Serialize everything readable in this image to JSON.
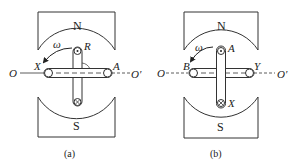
{
  "figure": {
    "panels": [
      {
        "caption": "(a)",
        "north_label": "N",
        "south_label": "S",
        "omega_label": "ω",
        "axis_left": "O",
        "axis_right": "O′",
        "left_end_label": "X",
        "right_end_label": "A",
        "top_label": "R",
        "bottom_label": ""
      },
      {
        "caption": "(b)",
        "north_label": "N",
        "south_label": "S",
        "omega_label": "ω",
        "axis_left": "O",
        "axis_right": "O′",
        "left_end_label": "B",
        "right_end_label": "Y",
        "top_label": "A",
        "bottom_label": "X"
      }
    ]
  }
}
